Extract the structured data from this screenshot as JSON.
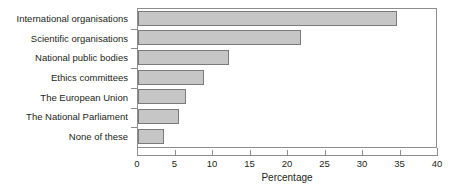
{
  "chart_data": {
    "type": "bar",
    "orientation": "horizontal",
    "title": "",
    "xlabel": "Percentage",
    "ylabel": "",
    "categories": [
      "International organisations",
      "Scientific organisations",
      "National public bodies",
      "Ethics committees",
      "The European Union",
      "The National Parliament",
      "None of these"
    ],
    "values": [
      34.5,
      21.7,
      12.1,
      8.8,
      6.4,
      5.4,
      3.4
    ],
    "xlim": [
      0,
      40
    ],
    "xticks": [
      0,
      5,
      10,
      15,
      20,
      25,
      30,
      35,
      40
    ],
    "xtick_labels": [
      "0",
      "5",
      "10",
      "15",
      "20",
      "25",
      "30",
      "35",
      "40"
    ],
    "grid": false,
    "legend": null,
    "bar_fill_color": "#c6c6c6",
    "bar_border_color": "#7a7a7a",
    "axis_color": "#8d8d8d",
    "text_color": "#231f20",
    "background_color": "#ffffff"
  }
}
